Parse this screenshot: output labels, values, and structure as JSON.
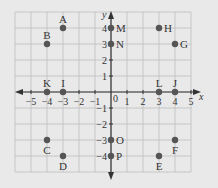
{
  "chart_data": {
    "type": "scatter",
    "title": "",
    "xlabel": "x",
    "ylabel": "y",
    "xlim": [
      -6,
      5
    ],
    "ylim": [
      -5,
      5
    ],
    "grid": true,
    "x_ticks": [
      -5,
      -4,
      -3,
      -2,
      -1,
      1,
      2,
      3,
      4,
      5
    ],
    "y_ticks": [
      -4,
      -3,
      -2,
      -1,
      1,
      2,
      3,
      4
    ],
    "x_tick_labels": [
      "−5",
      "−4",
      "−3",
      "−2",
      "−1",
      "1",
      "2",
      "3",
      "4",
      "5"
    ],
    "y_tick_labels": [
      "−4",
      "−3",
      "−2",
      "−1",
      "1",
      "2",
      "3",
      "4"
    ],
    "origin_label": "0",
    "points": [
      {
        "label": "A",
        "x": -3,
        "y": 4,
        "label_pos": "above"
      },
      {
        "label": "B",
        "x": -4,
        "y": 3,
        "label_pos": "above"
      },
      {
        "label": "C",
        "x": -4,
        "y": -3,
        "label_pos": "below"
      },
      {
        "label": "D",
        "x": -3,
        "y": -4,
        "label_pos": "below"
      },
      {
        "label": "E",
        "x": 3,
        "y": -4,
        "label_pos": "below"
      },
      {
        "label": "F",
        "x": 4,
        "y": -3,
        "label_pos": "below"
      },
      {
        "label": "G",
        "x": 4,
        "y": 3,
        "label_pos": "right"
      },
      {
        "label": "H",
        "x": 3,
        "y": 4,
        "label_pos": "right"
      },
      {
        "label": "I",
        "x": -3,
        "y": 0,
        "label_pos": "above"
      },
      {
        "label": "J",
        "x": 4,
        "y": 0,
        "label_pos": "above"
      },
      {
        "label": "K",
        "x": -4,
        "y": 0,
        "label_pos": "above"
      },
      {
        "label": "L",
        "x": 3,
        "y": 0,
        "label_pos": "above"
      },
      {
        "label": "M",
        "x": 0,
        "y": 4,
        "label_pos": "right"
      },
      {
        "label": "N",
        "x": 0,
        "y": 3,
        "label_pos": "right"
      },
      {
        "label": "O",
        "x": 0,
        "y": -3,
        "label_pos": "right"
      },
      {
        "label": "P",
        "x": 0,
        "y": -4,
        "label_pos": "right"
      }
    ]
  },
  "colors": {
    "background": "#e9e9e9",
    "grid": "#bdbdbd",
    "axis": "#333333",
    "point": "#555555",
    "text": "#333333"
  }
}
